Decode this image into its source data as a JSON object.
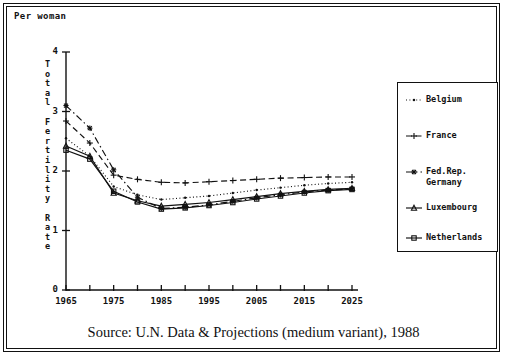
{
  "figure": {
    "unit_label": "Per woman",
    "caption": "Source: U.N. Data & Projections (medium variant), 1988"
  },
  "axes": {
    "y_axis_title_letters": [
      "T",
      "o",
      "t",
      "a",
      "l",
      "",
      "F",
      "e",
      "r",
      "t",
      "i",
      "l",
      "i",
      "t",
      "y",
      "",
      "R",
      "a",
      "t",
      "e"
    ],
    "y_axis_title": "Total Fertility Rate",
    "y_ticks": [
      "0",
      "1",
      "2",
      "3",
      "4"
    ],
    "x_ticks": [
      "1965",
      "1975",
      "1985",
      "1995",
      "2005",
      "2015",
      "2025"
    ]
  },
  "legend": {
    "entries": [
      {
        "label": "Belgium",
        "marker": "dotted-line-dot-marker"
      },
      {
        "label": "France",
        "marker": "dashed-line-plus-marker"
      },
      {
        "label": "Fed.Rep.\nGermany",
        "marker": "dashdot-line-star-marker"
      },
      {
        "label": "Luxembourg",
        "marker": "solid-line-triangle-marker"
      },
      {
        "label": "Netherlands",
        "marker": "solid-line-square-marker"
      }
    ]
  },
  "chart_data": {
    "type": "line",
    "title": "",
    "subtitle": "",
    "xlabel": "",
    "ylabel": "Total Fertility Rate",
    "unit": "Per woman",
    "source": "U.N. Data & Projections (medium variant), 1988",
    "grid": false,
    "legend_position": "right",
    "xlim": [
      1965,
      2025
    ],
    "ylim": [
      0,
      4
    ],
    "x_tick_step": 5,
    "x_labeled_step": 10,
    "x": [
      1965,
      1970,
      1975,
      1980,
      1985,
      1990,
      1995,
      2000,
      2005,
      2010,
      2015,
      2020,
      2025
    ],
    "series": [
      {
        "name": "Belgium",
        "color": "#111111",
        "style": "dotted",
        "marker": "dot",
        "values": [
          2.55,
          2.25,
          1.74,
          1.6,
          1.52,
          1.55,
          1.58,
          1.63,
          1.68,
          1.72,
          1.76,
          1.79,
          1.81
        ]
      },
      {
        "name": "France",
        "color": "#111111",
        "style": "dashed",
        "marker": "plus",
        "values": [
          2.84,
          2.47,
          1.93,
          1.86,
          1.81,
          1.8,
          1.82,
          1.84,
          1.86,
          1.88,
          1.89,
          1.9,
          1.9
        ]
      },
      {
        "name": "Fed.Rep. Germany",
        "color": "#111111",
        "style": "dashdot",
        "marker": "star",
        "values": [
          3.1,
          2.72,
          2.02,
          1.56,
          1.37,
          1.39,
          1.43,
          1.49,
          1.55,
          1.6,
          1.65,
          1.68,
          1.7
        ]
      },
      {
        "name": "Luxembourg",
        "color": "#111111",
        "style": "solid",
        "marker": "triangle",
        "values": [
          2.42,
          2.25,
          1.63,
          1.5,
          1.41,
          1.44,
          1.47,
          1.52,
          1.57,
          1.62,
          1.66,
          1.69,
          1.71
        ]
      },
      {
        "name": "Netherlands",
        "color": "#111111",
        "style": "solid",
        "marker": "square",
        "values": [
          2.35,
          2.2,
          1.66,
          1.48,
          1.36,
          1.38,
          1.42,
          1.47,
          1.53,
          1.58,
          1.63,
          1.67,
          1.69
        ]
      }
    ]
  }
}
